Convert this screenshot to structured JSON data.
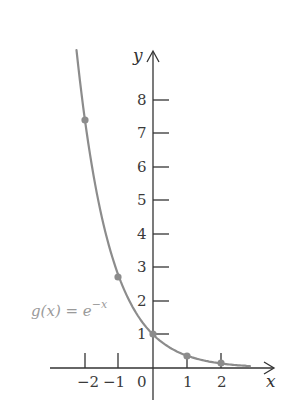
{
  "chart_data": {
    "type": "line",
    "title": "",
    "xlabel": "x",
    "ylabel": "y",
    "function_label": "g(x) = e^{-x}",
    "function_label_parts": {
      "lhs": "g(x) = e",
      "exp": "−x"
    },
    "x_ticks": [
      "-2",
      "-1",
      "0",
      "1",
      "2"
    ],
    "y_ticks": [
      "1",
      "2",
      "3",
      "4",
      "5",
      "6",
      "7",
      "8"
    ],
    "xlim": [
      -2.3,
      3.5
    ],
    "ylim": [
      -0.6,
      9.5
    ],
    "grid": false,
    "series": [
      {
        "name": "g(x) = e^-x",
        "color": "#8c8c8c",
        "highlighted_points": [
          {
            "x": -2,
            "y": 7.39
          },
          {
            "x": -1,
            "y": 2.72
          },
          {
            "x": 0,
            "y": 1
          },
          {
            "x": 1,
            "y": 0.37
          },
          {
            "x": 2,
            "y": 0.14
          }
        ]
      }
    ]
  },
  "labels": {
    "x_axis": "x",
    "y_axis": "y",
    "ticks_x": {
      "m2": "−2",
      "m1": "−1",
      "z": "0",
      "p1": "1",
      "p2": "2"
    },
    "ticks_y": {
      "t1": "1",
      "t2": "2",
      "t3": "3",
      "t4": "4",
      "t5": "5",
      "t6": "6",
      "t7": "7",
      "t8": "8"
    },
    "fn_lhs": "g(x) = e",
    "fn_exp": "−x"
  }
}
